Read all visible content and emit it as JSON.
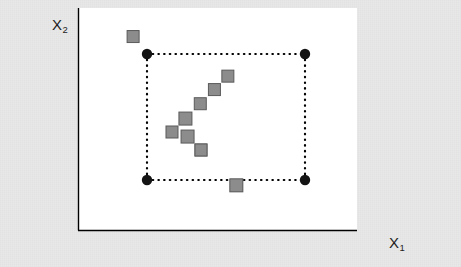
{
  "figure": {
    "background_color": "#e8e8e8",
    "panel_color": "#ffffff",
    "axis_color": "#000000",
    "panel": {
      "x": 78,
      "y": 8,
      "width": 279,
      "height": 222
    }
  },
  "axes": {
    "y_label": "X",
    "y_label_sub": "2",
    "x_label": "X",
    "x_label_sub": "1"
  },
  "chart_data": {
    "type": "scatter",
    "title": "",
    "xlabel": "X1",
    "ylabel": "X2",
    "xlim": [
      0,
      1
    ],
    "ylim": [
      0,
      1
    ],
    "grid": false,
    "legend": null,
    "annotations": [],
    "series": [
      {
        "name": "corner-points",
        "marker": "circle",
        "color": "#141414",
        "edge_color": "#000000",
        "size": 9,
        "points": [
          {
            "x": 147,
            "y": 54,
            "label": "top-left-corner"
          },
          {
            "x": 305,
            "y": 54,
            "label": "top-right-corner"
          },
          {
            "x": 147,
            "y": 180,
            "label": "bottom-left-corner"
          },
          {
            "x": 305,
            "y": 180,
            "label": "bottom-right-corner"
          }
        ]
      },
      {
        "name": "star-points",
        "marker": "diamond",
        "color": "#8c8c8c",
        "edge_color": "#5a5a5a",
        "size": 13,
        "points": [
          {
            "x": 242,
            "y": 62,
            "label": "axial-top-1"
          },
          {
            "x": 242,
            "y": 82,
            "label": "axial-top-2"
          },
          {
            "x": 242,
            "y": 101,
            "label": "axial-top-3"
          },
          {
            "x": 242,
            "y": 121,
            "label": "center"
          },
          {
            "x": 242,
            "y": 142,
            "label": "axial-bottom-1"
          },
          {
            "x": 242,
            "y": 161,
            "label": "axial-bottom-2"
          },
          {
            "x": 147,
            "y": 121,
            "label": "axial-left-1"
          },
          {
            "x": 172,
            "y": 121,
            "label": "axial-left-2"
          },
          {
            "x": 194,
            "y": 121,
            "label": "axial-left-3"
          },
          {
            "x": 213,
            "y": 121,
            "label": "axial-left-4"
          },
          {
            "x": 263,
            "y": 121,
            "label": "axial-right-1"
          }
        ]
      }
    ],
    "shapes": [
      {
        "type": "rectangle",
        "name": "design-region-box",
        "style": "dotted",
        "color": "#000000",
        "x0": 147,
        "y0": 54,
        "x1": 305,
        "y1": 180
      }
    ]
  }
}
